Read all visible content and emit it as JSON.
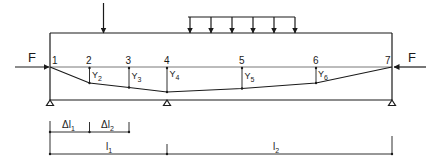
{
  "diagram": {
    "type": "continuous beam deflection under axial compression",
    "colors": {
      "line": "#1a1a1a",
      "background": "#ffffff"
    },
    "forces": {
      "left": {
        "label": "F",
        "direction": "right"
      },
      "right": {
        "label": "F",
        "direction": "left"
      }
    },
    "loads": {
      "point_load": {
        "arrow_count": 1
      },
      "distributed_load": {
        "arrow_count": 5
      }
    },
    "nodes": [
      {
        "id": "1",
        "label": "1"
      },
      {
        "id": "2",
        "label": "2",
        "deflection": "Y",
        "sub": "2"
      },
      {
        "id": "3",
        "label": "3",
        "deflection": "Y",
        "sub": "3"
      },
      {
        "id": "4",
        "label": "4",
        "deflection": "Y",
        "sub": "4"
      },
      {
        "id": "5",
        "label": "5",
        "deflection": "Y",
        "sub": "5"
      },
      {
        "id": "6",
        "label": "6",
        "deflection": "Y",
        "sub": "6"
      },
      {
        "id": "7",
        "label": "7"
      }
    ],
    "supports": [
      "left",
      "middle",
      "right"
    ],
    "dimensions": {
      "dl1": {
        "main": "Δl",
        "sub": "1"
      },
      "dl2": {
        "main": "Δl",
        "sub": "2"
      },
      "l1": {
        "main": "l",
        "sub": "1"
      },
      "l2": {
        "main": "l",
        "sub": "2"
      }
    }
  }
}
